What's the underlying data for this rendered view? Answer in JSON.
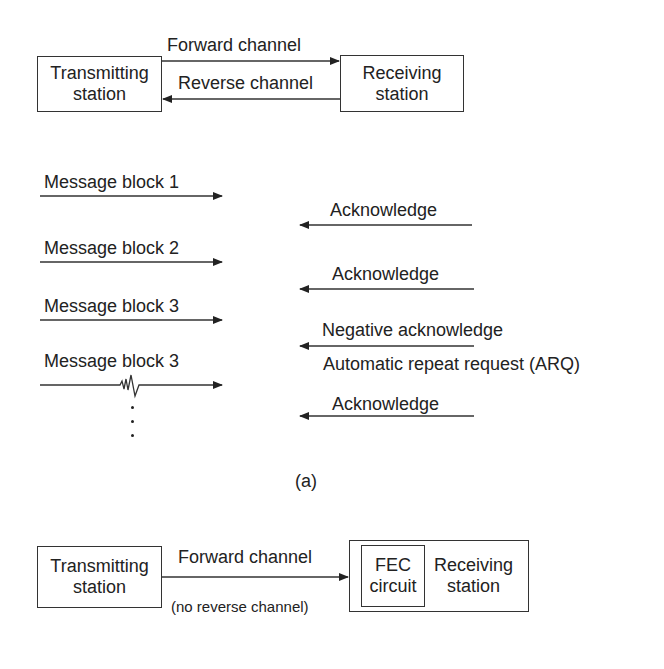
{
  "part_a": {
    "transmitter": {
      "line1": "Transmitting",
      "line2": "station"
    },
    "receiver": {
      "line1": "Receiving",
      "line2": "station"
    },
    "forward_channel": "Forward channel",
    "reverse_channel": "Reverse channel",
    "messages": [
      {
        "label": "Message block 1"
      },
      {
        "label": "Message block 2"
      },
      {
        "label": "Message block 3"
      },
      {
        "label": "Message block 3",
        "noise": true
      }
    ],
    "responses": [
      {
        "label": "Acknowledge"
      },
      {
        "label": "Acknowledge"
      },
      {
        "label": "Negative acknowledge",
        "sublabel": "Automatic repeat request (ARQ)"
      },
      {
        "label": "Acknowledge"
      }
    ],
    "caption": "(a)"
  },
  "part_b": {
    "transmitter": {
      "line1": "Transmitting",
      "line2": "station"
    },
    "forward_channel": "Forward channel",
    "no_reverse_note": "(no reverse channel)",
    "fec": {
      "line1": "FEC",
      "line2": "circuit"
    },
    "receiver": {
      "line1": "Receiving",
      "line2": "station"
    }
  }
}
